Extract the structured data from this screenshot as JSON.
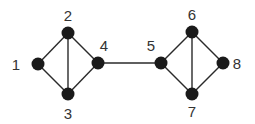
{
  "diagram": {
    "type": "graph",
    "nodes": [
      {
        "id": "1",
        "label": "1",
        "x": 38,
        "y": 64,
        "lx": 16,
        "ly": 70
      },
      {
        "id": "2",
        "label": "2",
        "x": 68,
        "y": 33,
        "lx": 68,
        "ly": 21
      },
      {
        "id": "3",
        "label": "3",
        "x": 68,
        "y": 94,
        "lx": 68,
        "ly": 119
      },
      {
        "id": "4",
        "label": "4",
        "x": 98,
        "y": 63,
        "lx": 104,
        "ly": 51
      },
      {
        "id": "5",
        "label": "5",
        "x": 161,
        "y": 63,
        "lx": 151,
        "ly": 51
      },
      {
        "id": "6",
        "label": "6",
        "x": 192,
        "y": 32,
        "lx": 192,
        "ly": 20
      },
      {
        "id": "7",
        "label": "7",
        "x": 192,
        "y": 94,
        "lx": 192,
        "ly": 117
      },
      {
        "id": "8",
        "label": "8",
        "x": 223,
        "y": 63,
        "lx": 237,
        "ly": 69
      }
    ],
    "edges": [
      [
        "1",
        "2"
      ],
      [
        "1",
        "3"
      ],
      [
        "2",
        "3"
      ],
      [
        "2",
        "4"
      ],
      [
        "3",
        "4"
      ],
      [
        "4",
        "5"
      ],
      [
        "5",
        "6"
      ],
      [
        "5",
        "7"
      ],
      [
        "6",
        "7"
      ],
      [
        "6",
        "8"
      ],
      [
        "7",
        "8"
      ]
    ]
  }
}
